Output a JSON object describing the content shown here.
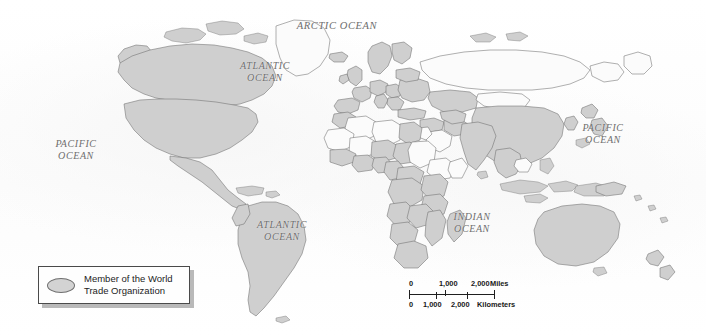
{
  "map": {
    "title": "World Trade Organization membership world map",
    "projection": "world",
    "colors": {
      "member_fill": "#cfcfcf",
      "nonmember_fill": "#fbfbfb",
      "border": "#6e6e6e",
      "coastline": "#5a5a5a",
      "background": "#fdfdfd",
      "label_text": "#6d6d6d",
      "legend_text": "#1c1c1c",
      "legend_border": "#4a4a4a",
      "legend_shadow": "#b9b9b9"
    },
    "ocean_labels": [
      {
        "name": "arctic-ocean",
        "text": "ARCTIC OCEAN",
        "x": 337,
        "y": 26,
        "size": 10.5
      },
      {
        "name": "atlantic-ocean-north",
        "text": "ATLANTIC\nOCEAN",
        "x": 265,
        "y": 72,
        "size": 10
      },
      {
        "name": "atlantic-ocean-south",
        "text": "ATLANTIC\nOCEAN",
        "x": 282,
        "y": 231,
        "size": 10
      },
      {
        "name": "pacific-ocean-west",
        "text": "PACIFIC\nOCEAN",
        "x": 76,
        "y": 150,
        "size": 10
      },
      {
        "name": "pacific-ocean-east",
        "text": "PACIFIC\nOCEAN",
        "x": 603,
        "y": 134,
        "size": 10
      },
      {
        "name": "indian-ocean",
        "text": "INDIAN\nOCEAN",
        "x": 472,
        "y": 223,
        "size": 10
      }
    ]
  },
  "legend": {
    "label": "Member of the World\nTrade Organization",
    "swatch_shape": "oval",
    "swatch_color": "#d3d3d3"
  },
  "scale_bar": {
    "miles": {
      "unit_label": "Miles",
      "ticks": [
        "0",
        "1,000",
        "2,000"
      ]
    },
    "kilometers": {
      "unit_label": "Kilometers",
      "ticks": [
        "0",
        "1,000",
        "2,000"
      ]
    }
  }
}
